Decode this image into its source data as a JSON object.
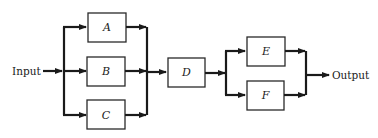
{
  "diagram": {
    "type": "reliability block diagram",
    "input_label": "Input",
    "output_label": "Output",
    "blocks": [
      {
        "id": "A",
        "label": "A",
        "group": "parallel-1"
      },
      {
        "id": "B",
        "label": "B",
        "group": "parallel-1"
      },
      {
        "id": "C",
        "label": "C",
        "group": "parallel-1"
      },
      {
        "id": "D",
        "label": "D",
        "group": "series"
      },
      {
        "id": "E",
        "label": "E",
        "group": "parallel-2"
      },
      {
        "id": "F",
        "label": "F",
        "group": "parallel-2"
      }
    ],
    "structure": "Input -> (A || B || C) -> D -> (E || F) -> Output",
    "colors": {
      "line": "#1a1a1a",
      "box_border": "#2a2a2a",
      "background": "#ffffff"
    }
  }
}
